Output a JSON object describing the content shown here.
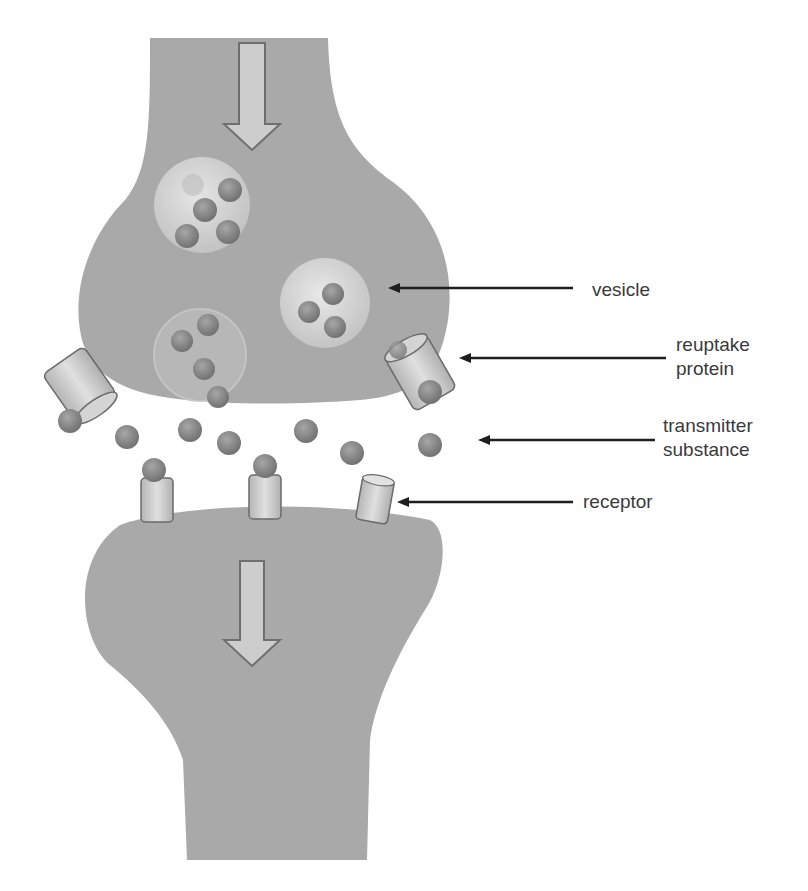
{
  "diagram": {
    "colors": {
      "neuron_fill": "#a9a9a9",
      "neuron_shade": "#9a9a9a",
      "vesicle_fill": "#d6d6d6",
      "transmitter_fill": "#8a8a8a",
      "transmitter_stroke": "#5e5e5e",
      "receptor_fill": "#cfcfcf",
      "arrow_outline": "#6f6f6f",
      "arrow_fill": "#cdcdcd",
      "pointer_line": "#1e1e1e",
      "label_text": "#3a3a3a"
    },
    "labels": [
      {
        "id": "vesicle",
        "lines": [
          "vesicle"
        ]
      },
      {
        "id": "reuptake-protein",
        "lines": [
          "reuptake",
          "protein"
        ]
      },
      {
        "id": "transmitter-substance",
        "lines": [
          "transmitter",
          "substance"
        ]
      },
      {
        "id": "receptor",
        "lines": [
          "receptor"
        ]
      }
    ],
    "flow_arrows": [
      {
        "id": "presynaptic-direction",
        "direction": "down"
      },
      {
        "id": "postsynaptic-direction",
        "direction": "down"
      }
    ]
  }
}
